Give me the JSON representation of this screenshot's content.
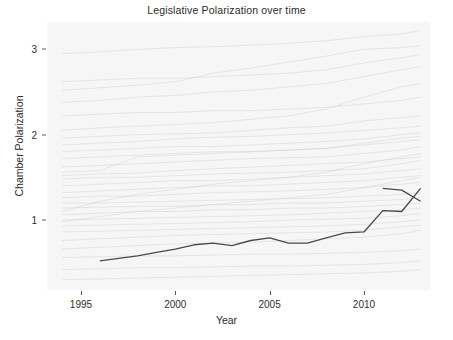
{
  "chart_data": {
    "type": "line",
    "title": "Legislative Polarization over time",
    "xlabel": "Year",
    "ylabel": "Chamber Polarization",
    "xlim": [
      1993.2,
      2013.5
    ],
    "ylim": [
      0.18,
      3.32
    ],
    "grid": false,
    "legend": "none",
    "xticks": [
      1995,
      2000,
      2005,
      2010
    ],
    "xtick_labels": [
      "1995",
      "2000",
      "2005",
      "2010"
    ],
    "yticks": [
      1,
      2,
      3
    ],
    "ytick_labels": [
      "1",
      "2",
      "3"
    ],
    "highlight_color": "#4a4a4a",
    "background_series_color": "#c9c9c9",
    "panel_color": "#f6f6f6",
    "series": [
      {
        "name": "highlighted-chamber",
        "emphasis": "foreground",
        "x": [
          1996,
          1997,
          1998,
          1999,
          2000,
          2001,
          2002,
          2003,
          2004,
          2005,
          2006,
          2007,
          2008,
          2009,
          2010,
          2011,
          2012,
          2013
        ],
        "values": [
          0.52,
          0.55,
          0.58,
          0.62,
          0.66,
          0.71,
          0.73,
          0.7,
          0.76,
          0.79,
          0.73,
          0.73,
          0.79,
          0.85,
          0.86,
          1.11,
          1.1,
          1.37
        ]
      },
      {
        "name": "highlighted-chamber-tail",
        "emphasis": "foreground",
        "x": [
          2011,
          2012,
          2013
        ],
        "values": [
          1.37,
          1.35,
          1.22
        ]
      },
      {
        "name": "bg-1",
        "emphasis": "background",
        "x": [
          1994,
          1996,
          1998,
          2000,
          2002,
          2004,
          2006,
          2008,
          2010,
          2012,
          2013
        ],
        "values": [
          2.95,
          2.97,
          3.0,
          3.02,
          3.03,
          3.05,
          3.07,
          3.1,
          3.15,
          3.18,
          3.22
        ]
      },
      {
        "name": "bg-2",
        "emphasis": "background",
        "x": [
          1994,
          1996,
          1998,
          2000,
          2002,
          2004,
          2006,
          2008,
          2010,
          2012,
          2013
        ],
        "values": [
          2.52,
          2.55,
          2.58,
          2.62,
          2.72,
          2.78,
          2.85,
          2.92,
          3.0,
          3.02,
          3.04
        ]
      },
      {
        "name": "bg-3",
        "emphasis": "background",
        "x": [
          1994,
          1996,
          1998,
          2000,
          2002,
          2004,
          2006,
          2008,
          2010,
          2012,
          2013
        ],
        "values": [
          2.38,
          2.4,
          2.44,
          2.46,
          2.5,
          2.52,
          2.56,
          2.6,
          2.68,
          2.76,
          2.8
        ]
      },
      {
        "name": "bg-4",
        "emphasis": "background",
        "x": [
          1994,
          1996,
          1998,
          2000,
          2002,
          2004,
          2006,
          2008,
          2010,
          2012,
          2013
        ],
        "values": [
          2.05,
          2.08,
          2.1,
          2.12,
          2.14,
          2.18,
          2.22,
          2.3,
          2.44,
          2.56,
          2.6
        ]
      },
      {
        "name": "bg-5",
        "emphasis": "background",
        "x": [
          1994,
          1996,
          1998,
          2000,
          2002,
          2004,
          2006,
          2008,
          2010,
          2012,
          2013
        ],
        "values": [
          1.96,
          1.98,
          2.0,
          2.01,
          2.02,
          2.05,
          2.08,
          2.1,
          2.16,
          2.2,
          2.22
        ]
      },
      {
        "name": "bg-6",
        "emphasis": "background",
        "x": [
          1994,
          1996,
          1998,
          2000,
          2002,
          2004,
          2006,
          2008,
          2010,
          2012,
          2013
        ],
        "values": [
          1.88,
          1.9,
          1.92,
          1.95,
          1.97,
          1.98,
          2.0,
          2.02,
          2.05,
          2.08,
          2.1
        ]
      },
      {
        "name": "bg-7",
        "emphasis": "background",
        "x": [
          1994,
          1996,
          1998,
          2000,
          2002,
          2004,
          2006,
          2008,
          2010,
          2012,
          2013
        ],
        "values": [
          1.8,
          1.82,
          1.84,
          1.86,
          1.86,
          1.88,
          1.9,
          1.92,
          1.95,
          2.0,
          2.02
        ]
      },
      {
        "name": "bg-8",
        "emphasis": "background",
        "x": [
          1994,
          1996,
          1998,
          2000,
          2002,
          2004,
          2006,
          2008,
          2010,
          2012,
          2013
        ],
        "values": [
          1.72,
          1.74,
          1.76,
          1.78,
          1.8,
          1.8,
          1.82,
          1.84,
          1.88,
          1.92,
          1.94
        ]
      },
      {
        "name": "bg-9",
        "emphasis": "background",
        "x": [
          1994,
          1996,
          1998,
          2000,
          2002,
          2004,
          2006,
          2008,
          2010,
          2012,
          2013
        ],
        "values": [
          1.62,
          1.64,
          1.66,
          1.68,
          1.7,
          1.72,
          1.73,
          1.74,
          1.78,
          1.82,
          1.86
        ]
      },
      {
        "name": "bg-10",
        "emphasis": "background",
        "x": [
          1994,
          1996,
          1998,
          2000,
          2002,
          2004,
          2006,
          2008,
          2010,
          2012,
          2013
        ],
        "values": [
          1.52,
          1.54,
          1.55,
          1.58,
          1.6,
          1.62,
          1.64,
          1.66,
          1.68,
          1.72,
          1.74
        ]
      },
      {
        "name": "bg-11",
        "emphasis": "background",
        "x": [
          1994,
          1996,
          1998,
          2000,
          2002,
          2004,
          2006,
          2008,
          2010,
          2012,
          2013
        ],
        "values": [
          1.48,
          1.5,
          1.5,
          1.52,
          1.54,
          1.55,
          1.56,
          1.58,
          1.6,
          1.66,
          1.7
        ]
      },
      {
        "name": "bg-12",
        "emphasis": "background",
        "x": [
          1994,
          1996,
          1998,
          2000,
          2002,
          2004,
          2006,
          2008,
          2010,
          2012,
          2013
        ],
        "values": [
          1.4,
          1.42,
          1.44,
          1.46,
          1.46,
          1.48,
          1.5,
          1.52,
          1.54,
          1.58,
          1.6
        ]
      },
      {
        "name": "bg-13",
        "emphasis": "background",
        "x": [
          1994,
          1996,
          1998,
          2000,
          2002,
          2004,
          2006,
          2008,
          2010,
          2012,
          2013
        ],
        "values": [
          1.32,
          1.34,
          1.36,
          1.38,
          1.4,
          1.4,
          1.42,
          1.44,
          1.46,
          1.5,
          1.52
        ]
      },
      {
        "name": "bg-14",
        "emphasis": "background",
        "x": [
          1994,
          1996,
          1998,
          2000,
          2002,
          2004,
          2006,
          2008,
          2010,
          2012,
          2013
        ],
        "values": [
          1.26,
          1.28,
          1.28,
          1.3,
          1.32,
          1.33,
          1.34,
          1.36,
          1.38,
          1.42,
          1.44
        ]
      },
      {
        "name": "bg-15",
        "emphasis": "background",
        "x": [
          1994,
          1996,
          1998,
          2000,
          2002,
          2004,
          2006,
          2008,
          2010,
          2012,
          2013
        ],
        "values": [
          1.2,
          1.2,
          1.21,
          1.22,
          1.23,
          1.24,
          1.25,
          1.26,
          1.28,
          1.3,
          1.32
        ]
      },
      {
        "name": "bg-16",
        "emphasis": "background",
        "x": [
          1994,
          1996,
          1998,
          2000,
          2002,
          2004,
          2006,
          2008,
          2010,
          2012,
          2013
        ],
        "values": [
          1.14,
          1.15,
          1.16,
          1.16,
          1.18,
          1.18,
          1.2,
          1.2,
          1.22,
          1.24,
          1.26
        ]
      },
      {
        "name": "bg-17",
        "emphasis": "background",
        "x": [
          1994,
          1996,
          1998,
          2000,
          2002,
          2004,
          2006,
          2008,
          2010,
          2012,
          2013
        ],
        "values": [
          1.06,
          1.08,
          1.1,
          1.1,
          1.12,
          1.12,
          1.14,
          1.14,
          1.16,
          1.18,
          1.2
        ]
      },
      {
        "name": "bg-18",
        "emphasis": "background",
        "x": [
          1994,
          1996,
          1998,
          2000,
          2002,
          2004,
          2006,
          2008,
          2010,
          2012,
          2013
        ],
        "values": [
          1.0,
          1.01,
          1.02,
          1.03,
          1.04,
          1.05,
          1.06,
          1.08,
          1.1,
          1.12,
          1.14
        ]
      },
      {
        "name": "bg-19",
        "emphasis": "background",
        "x": [
          1994,
          1996,
          1998,
          2000,
          2002,
          2004,
          2006,
          2008,
          2010,
          2012,
          2013
        ],
        "values": [
          0.93,
          0.94,
          0.95,
          0.96,
          0.97,
          0.98,
          1.0,
          1.01,
          1.02,
          1.05,
          1.08
        ]
      },
      {
        "name": "bg-20",
        "emphasis": "background",
        "x": [
          1994,
          1996,
          1998,
          2000,
          2002,
          2004,
          2006,
          2008,
          2010,
          2012,
          2013
        ],
        "values": [
          0.86,
          0.87,
          0.88,
          0.89,
          0.9,
          0.91,
          0.92,
          0.93,
          0.95,
          0.98,
          1.0
        ]
      },
      {
        "name": "bg-21",
        "emphasis": "background",
        "x": [
          1994,
          1996,
          1998,
          2000,
          2002,
          2004,
          2006,
          2008,
          2010,
          2012,
          2013
        ],
        "values": [
          0.76,
          0.78,
          0.8,
          0.82,
          0.83,
          0.84,
          0.85,
          0.86,
          0.88,
          0.92,
          0.94
        ]
      },
      {
        "name": "bg-22",
        "emphasis": "background",
        "x": [
          1994,
          1996,
          1998,
          2000,
          2002,
          2004,
          2006,
          2008,
          2010,
          2012,
          2013
        ],
        "values": [
          0.66,
          0.68,
          0.7,
          0.72,
          0.73,
          0.74,
          0.76,
          0.78,
          0.8,
          0.84,
          0.88
        ]
      },
      {
        "name": "bg-23",
        "emphasis": "background",
        "x": [
          1994,
          1996,
          1998,
          2000,
          2002,
          2004,
          2006,
          2008,
          2010,
          2012,
          2013
        ],
        "values": [
          0.56,
          0.57,
          0.58,
          0.58,
          0.59,
          0.6,
          0.6,
          0.61,
          0.62,
          0.64,
          0.66
        ]
      },
      {
        "name": "bg-24",
        "emphasis": "background",
        "x": [
          1994,
          1996,
          1998,
          2000,
          2002,
          2004,
          2006,
          2008,
          2010,
          2012,
          2013
        ],
        "values": [
          0.42,
          0.43,
          0.44,
          0.44,
          0.45,
          0.46,
          0.46,
          0.47,
          0.48,
          0.5,
          0.52
        ]
      },
      {
        "name": "bg-25",
        "emphasis": "background",
        "x": [
          1994,
          1996,
          1998,
          2000,
          2002,
          2004,
          2006,
          2008,
          2010,
          2012,
          2013
        ],
        "values": [
          0.3,
          0.31,
          0.32,
          0.33,
          0.34,
          0.35,
          0.36,
          0.37,
          0.38,
          0.4,
          0.42
        ]
      },
      {
        "name": "bg-26",
        "emphasis": "background",
        "x": [
          1994,
          1996,
          1998,
          2000,
          2002,
          2004,
          2006,
          2008,
          2010,
          2012,
          2013
        ],
        "values": [
          2.22,
          2.24,
          2.26,
          2.26,
          2.28,
          2.28,
          2.3,
          2.32,
          2.36,
          2.4,
          2.44
        ]
      },
      {
        "name": "bg-27",
        "emphasis": "background",
        "x": [
          1994,
          1996,
          1998,
          2000,
          2002,
          2004,
          2006,
          2008,
          2010,
          2012,
          2013
        ],
        "values": [
          1.56,
          1.58,
          1.74,
          1.76,
          1.78,
          1.8,
          1.82,
          1.84,
          1.9,
          1.96,
          1.98
        ]
      },
      {
        "name": "bg-28",
        "emphasis": "background",
        "x": [
          1994,
          1996,
          1998,
          2000,
          2002,
          2004,
          2006,
          2008,
          2010,
          2012,
          2013
        ],
        "values": [
          1.1,
          1.22,
          1.3,
          1.36,
          1.42,
          1.46,
          1.5,
          1.56,
          1.66,
          1.74,
          1.78
        ]
      },
      {
        "name": "bg-29",
        "emphasis": "background",
        "x": [
          1994,
          1996,
          1998,
          2000,
          2002,
          2004,
          2006,
          2008,
          2010,
          2012,
          2013
        ],
        "values": [
          0.98,
          1.04,
          1.1,
          1.14,
          1.18,
          1.22,
          1.26,
          1.3,
          1.38,
          1.46,
          1.5
        ]
      },
      {
        "name": "bg-30",
        "emphasis": "background",
        "x": [
          1994,
          1996,
          1998,
          2000,
          2002,
          2004,
          2006,
          2008,
          2010,
          2012,
          2013
        ],
        "values": [
          2.62,
          2.64,
          2.66,
          2.66,
          2.68,
          2.7,
          2.72,
          2.76,
          2.84,
          2.9,
          2.94
        ]
      }
    ]
  }
}
